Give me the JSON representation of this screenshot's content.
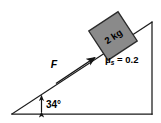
{
  "figure": {
    "background_color": "#ffffff",
    "line_color": "#1a1a1a",
    "block_fill_color": "#8a8a8a",
    "block_edge_color": "#2b2b2b"
  },
  "incline": {
    "angle_label": "34°",
    "angle_value": 34,
    "angle_unit": "degrees",
    "base_left_x": 12,
    "base_right_x": 152,
    "base_y": 114,
    "apex_x": 152,
    "apex_y": 22
  },
  "block": {
    "mass_label": "2 kg",
    "mass_value": 2,
    "mass_unit": "kg",
    "center_x": 113,
    "center_y": 36,
    "size": 36
  },
  "force": {
    "label": "F",
    "direction": "up the incline",
    "tail_x": 58,
    "tail_y": 82,
    "tip_x": 97,
    "tip_y": 56
  },
  "friction": {
    "symbol": "μ",
    "subscript": "s",
    "equals": " = ",
    "value": "0.2",
    "full_label": "μs = 0.2"
  }
}
